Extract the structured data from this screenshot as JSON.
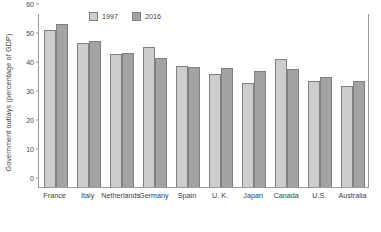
{
  "chart_data": {
    "type": "bar",
    "title": "",
    "xlabel": "",
    "ylabel": "Government outlays (percentage of GDP)",
    "ylim": [
      0,
      60
    ],
    "yticks": [
      0,
      10,
      20,
      30,
      40,
      50,
      60
    ],
    "grid": false,
    "legend_position": "top-center",
    "categories": [
      "France",
      "Italy",
      "Netherlands",
      "Germany",
      "Spain",
      "U. K.",
      "Japan",
      "Canada",
      "U.S.",
      "Australia"
    ],
    "series": [
      {
        "name": "1997",
        "color": "#cdcdcd",
        "values": [
          54.1,
          49.7,
          46.0,
          48.2,
          41.9,
          38.9,
          36.0,
          44.3,
          36.5,
          34.8
        ]
      },
      {
        "name": "2016",
        "color": "#a3a3a3",
        "values": [
          56.2,
          50.3,
          46.2,
          44.5,
          41.5,
          41.1,
          39.9,
          40.6,
          38.1,
          36.4
        ]
      }
    ]
  },
  "axis": {
    "tick_labels": [
      "0",
      "10",
      "20",
      "30",
      "40",
      "50",
      "60"
    ]
  }
}
